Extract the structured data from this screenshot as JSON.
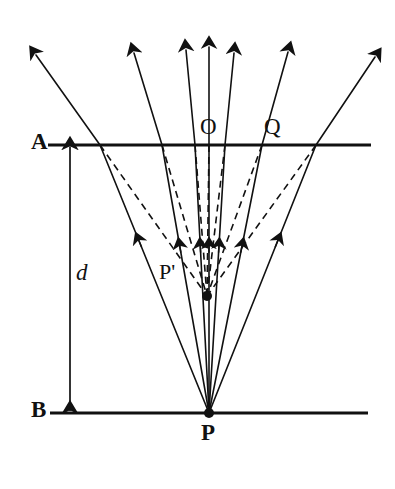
{
  "figure": {
    "type": "optics-ray-diagram",
    "background_color": "#ffffff",
    "stroke_color": "#111111",
    "width": 395,
    "height": 489
  },
  "labels": {
    "surface_top": "A",
    "surface_bottom": "B",
    "depth": "d",
    "normal_point": "O",
    "refraction_point": "Q",
    "virtual_image": "P'",
    "source": "P"
  },
  "geometry": {
    "surface_A": {
      "y": 145,
      "x1": 48,
      "x2": 371
    },
    "surface_B": {
      "y": 413,
      "x1": 50,
      "x2": 368
    },
    "source_point": {
      "x": 209,
      "y": 413
    },
    "image_point": {
      "x": 207,
      "y": 296
    },
    "depth_arrow": {
      "x": 70,
      "y_top": 147,
      "y_bottom": 411
    },
    "rays": [
      {
        "name": "ray-far-left",
        "incidence_x": 100,
        "exit_x": 36,
        "exit_y": 55,
        "incident_arrow_t": 0.62
      },
      {
        "name": "ray-left",
        "incidence_x": 162,
        "exit_x": 134,
        "exit_y": 53,
        "incident_arrow_t": 0.6
      },
      {
        "name": "ray-mid-left",
        "incidence_x": 195,
        "exit_x": 186,
        "exit_y": 50,
        "incident_arrow_t": 0.6
      },
      {
        "name": "ray-normal-O",
        "incidence_x": 209,
        "exit_x": 209,
        "exit_y": 47,
        "incident_arrow_t": 0.6
      },
      {
        "name": "ray-mid-right",
        "incidence_x": 225,
        "exit_x": 234,
        "exit_y": 53,
        "incident_arrow_t": 0.6
      },
      {
        "name": "ray-right-Q",
        "incidence_x": 262,
        "exit_x": 288,
        "exit_y": 52,
        "incident_arrow_t": 0.6
      },
      {
        "name": "ray-far-right",
        "incidence_x": 316,
        "exit_x": 375,
        "exit_y": 57,
        "incident_arrow_t": 0.62
      }
    ]
  },
  "styles": {
    "solid_line_width": 1.6,
    "surface_line_width": 3.2,
    "dashed_pattern": "7,5",
    "dot_radius": 5
  }
}
